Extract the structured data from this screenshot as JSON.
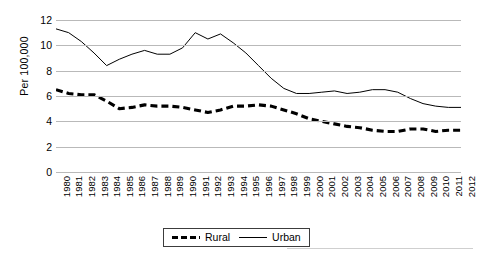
{
  "axes": {
    "ylabel": "Per 100,000",
    "yticks": [
      "12",
      "10",
      "8",
      "6",
      "4",
      "2",
      "0"
    ]
  },
  "legend": {
    "rural_label": "Rural",
    "urban_label": "Urban"
  },
  "caption": {
    "text": ""
  },
  "chart_data": {
    "type": "line",
    "title": "",
    "xlabel": "",
    "ylabel": "Per 100,000",
    "ylim": [
      0,
      12
    ],
    "yticks": [
      0,
      2,
      4,
      6,
      8,
      10,
      12
    ],
    "grid": "horizontal",
    "legend_position": "bottom-center",
    "categories": [
      "1980",
      "1981",
      "1982",
      "1983",
      "1984",
      "1985",
      "1986",
      "1987",
      "1988",
      "1989",
      "1990",
      "1991",
      "1992",
      "1993",
      "1994",
      "1995",
      "1996",
      "1997",
      "1998",
      "1999",
      "2000",
      "2001",
      "2002",
      "2003",
      "2004",
      "2005",
      "2006",
      "2007",
      "2008",
      "2009",
      "2010",
      "2011",
      "2012"
    ],
    "series": [
      {
        "name": "Rural",
        "style": "dashed",
        "color": "#000000",
        "values": [
          6.5,
          6.2,
          6.1,
          6.1,
          5.6,
          5.0,
          5.1,
          5.3,
          5.2,
          5.2,
          5.1,
          4.9,
          4.7,
          4.9,
          5.2,
          5.2,
          5.3,
          5.2,
          4.9,
          4.6,
          4.2,
          4.0,
          3.8,
          3.6,
          3.5,
          3.3,
          3.2,
          3.2,
          3.4,
          3.4,
          3.2,
          3.3,
          3.3
        ]
      },
      {
        "name": "Urban",
        "style": "solid",
        "color": "#000000",
        "values": [
          11.3,
          11.0,
          10.3,
          9.4,
          8.4,
          8.9,
          9.3,
          9.6,
          9.3,
          9.3,
          9.8,
          11.0,
          10.5,
          10.9,
          10.2,
          9.4,
          8.4,
          7.4,
          6.6,
          6.2,
          6.2,
          6.3,
          6.4,
          6.2,
          6.3,
          6.5,
          6.5,
          6.3,
          5.8,
          5.4,
          5.2,
          5.1,
          5.1
        ]
      }
    ]
  }
}
